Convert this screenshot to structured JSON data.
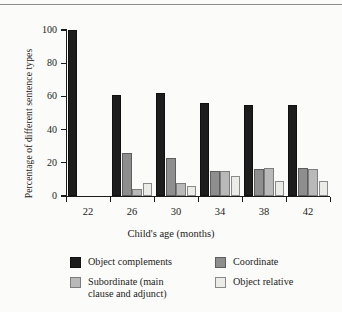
{
  "figure": {
    "background_color": "#fbfbf9",
    "ink_color": "#1b1b1b",
    "top_rule": "horizontal-rule"
  },
  "chart_data": {
    "type": "bar",
    "title": "",
    "xlabel": "Child's age (months)",
    "ylabel": "Percentage of different sentence types",
    "categories": [
      "22",
      "26",
      "30",
      "34",
      "38",
      "42"
    ],
    "ylim": [
      0,
      100
    ],
    "yticks": [
      0,
      20,
      40,
      60,
      80,
      100
    ],
    "ytick_labels": [
      "0",
      "20",
      "40",
      "60",
      "80",
      "100"
    ],
    "grid": false,
    "legend_position": "below",
    "series": [
      {
        "name": "Object complements",
        "color": "#1d1d1d",
        "values": [
          100,
          61,
          62,
          56,
          55,
          55
        ]
      },
      {
        "name": "Coordinate",
        "color": "#8e8e8e",
        "values": [
          null,
          26,
          23,
          15,
          16,
          17
        ]
      },
      {
        "name": "Subordinate (main\nclause and adjunct)",
        "color": "#b9b9b9",
        "values": [
          null,
          4,
          8,
          15,
          17,
          16
        ]
      },
      {
        "name": "Object relative",
        "color": "#ebebe8",
        "values": [
          null,
          8,
          6,
          12,
          9,
          9
        ]
      }
    ]
  },
  "legend": {
    "items": [
      {
        "label": "Object complements",
        "swatch": "legend-swatch-black"
      },
      {
        "label": "Coordinate",
        "swatch": "legend-swatch-dark-gray"
      },
      {
        "label": "Subordinate (main\nclause and adjunct)",
        "swatch": "legend-swatch-mid-gray"
      },
      {
        "label": "Object relative",
        "swatch": "legend-swatch-light-gray"
      }
    ]
  }
}
